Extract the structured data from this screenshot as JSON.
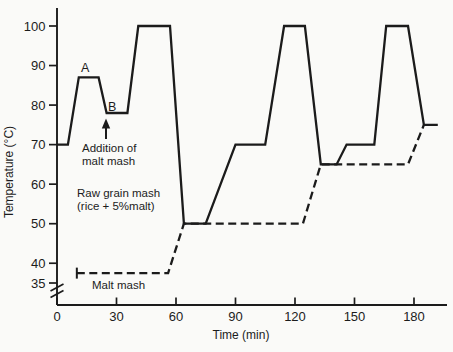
{
  "figure": {
    "background": "#fafaf8",
    "line_color": "#1b1b1b",
    "text_color": "#1c1c1c"
  },
  "chart_data": {
    "type": "line",
    "title": "",
    "xlabel": "Time (min)",
    "ylabel": "Temperature (°C)",
    "x_ticks": [
      0,
      30,
      60,
      90,
      120,
      150,
      180
    ],
    "y_ticks": [
      100,
      90,
      80,
      70,
      60,
      50,
      40,
      35
    ],
    "xlim": [
      0,
      197
    ],
    "ylim": [
      35,
      100
    ],
    "y_axis_break": true,
    "grid": false,
    "legend_position": "inline-annotations",
    "series": [
      {
        "name": "Raw grain mash (rice + 5%malt)",
        "line_style": "solid",
        "points": [
          [
            0,
            70
          ],
          [
            5.5,
            70
          ],
          [
            11,
            87
          ],
          [
            21,
            87
          ],
          [
            25,
            78
          ],
          [
            35.5,
            78
          ],
          [
            41,
            100
          ],
          [
            57,
            100
          ],
          [
            64,
            50
          ],
          [
            75,
            50
          ],
          [
            90,
            70
          ],
          [
            105,
            70
          ],
          [
            114.5,
            100
          ],
          [
            125,
            100
          ],
          [
            133,
            65
          ],
          [
            141,
            65
          ],
          [
            146,
            70
          ],
          [
            160,
            70
          ],
          [
            166,
            100
          ],
          [
            177,
            100
          ],
          [
            185,
            75
          ],
          [
            192,
            75
          ]
        ]
      },
      {
        "name": "Malt mash",
        "line_style": "dashed",
        "start_cap": true,
        "points": [
          [
            10,
            37.5
          ],
          [
            56,
            37.5
          ],
          [
            64,
            50
          ],
          [
            124,
            50
          ],
          [
            133,
            65
          ],
          [
            177,
            65
          ],
          [
            185,
            75
          ]
        ]
      }
    ],
    "annotations": {
      "point_a": {
        "text": "A"
      },
      "point_b": {
        "text": "B"
      },
      "addition": {
        "line1": "Addition of",
        "line2": "malt mash",
        "arrow": "up-arrow at start of B plateau"
      },
      "raw_grain": {
        "line1": "Raw grain mash",
        "line2": "(rice + 5%malt)"
      },
      "malt_mash": {
        "text": "Malt mash"
      }
    }
  }
}
